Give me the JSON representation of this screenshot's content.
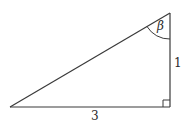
{
  "diagram": {
    "type": "right-triangle",
    "angle_label": "β",
    "side_labels": {
      "vertical": "1",
      "horizontal": "3"
    },
    "right_angle_marker": true,
    "colors": {
      "stroke": "#3a3a3a",
      "background": "#ffffff"
    }
  }
}
